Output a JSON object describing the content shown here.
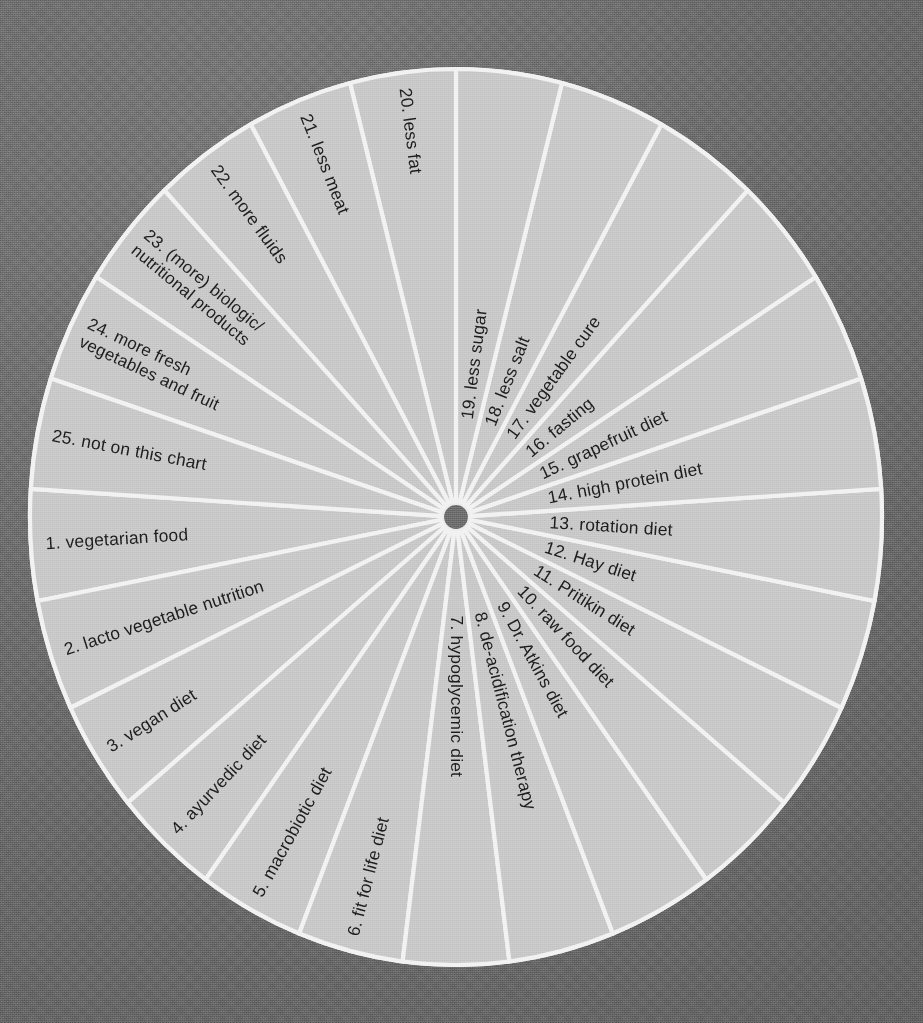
{
  "figure": {
    "type": "radial-wheel-diagram",
    "sector_count": 25,
    "background_color": "#6f6f6f",
    "sector_fill_color": "#c9c9c9",
    "divider_color": "#f2f2f2",
    "label_color": "#1d1d1d",
    "hub_color": "#6f6f6f"
  },
  "chart_data": {
    "type": "pie",
    "xlabel": "",
    "ylabel": "",
    "legend_position": "none",
    "grid": false,
    "note": "25 equal sectors of 14.4 degrees each; a divider line sits exactly at 12 o'clock between sector 19 and sector 20. Sector 1 begins just below the 9 o'clock position and numbering runs counter-clockwise... as drawn, numbers increase clockwise from the lower-left around the bottom and up the right side.",
    "categories": [
      "1. vegetarian food",
      "2. lacto vegetable nutrition",
      "3. vegan diet",
      "4. ayurvedic diet",
      "5. macrobiotic diet",
      "6. fit for life diet",
      "7. hypoglycemic diet",
      "8. de-acidification therapy",
      "9. Dr. Atkins diet",
      "10. raw food diet",
      "11. Pritikin diet",
      "12. Hay diet",
      "13. rotation diet",
      "14. high protein diet",
      "15. grapefruit diet",
      "16. fasting",
      "17. vegetable cure",
      "18. less salt",
      "19. less sugar",
      "20. less fat",
      "21. less meat",
      "22. more fluids",
      "23. (more) biologic/ nutritional products",
      "24. more fresh vegetables and fruit",
      "25. not on this chart"
    ],
    "values": [
      4,
      4,
      4,
      4,
      4,
      4,
      4,
      4,
      4,
      4,
      4,
      4,
      4,
      4,
      4,
      4,
      4,
      4,
      4,
      4,
      4,
      4,
      4,
      4,
      4
    ]
  },
  "sectors": [
    {
      "number": "1.",
      "text": "vegetarian food",
      "lines": [
        "1.  vegetarian food"
      ]
    },
    {
      "number": "2.",
      "text": "lacto vegetable nutrition",
      "lines": [
        "2.  lacto vegetable nutrition"
      ]
    },
    {
      "number": "3.",
      "text": "vegan diet",
      "lines": [
        "3.  vegan diet"
      ]
    },
    {
      "number": "4.",
      "text": "ayurvedic diet",
      "lines": [
        "4.  ayurvedic diet"
      ]
    },
    {
      "number": "5.",
      "text": "macrobiotic diet",
      "lines": [
        "5.  macrobiotic diet"
      ]
    },
    {
      "number": "6.",
      "text": "fit for life diet",
      "lines": [
        "6.  fit for life diet"
      ]
    },
    {
      "number": "7.",
      "text": "hypoglycemic diet",
      "lines": [
        "7.  hypoglycemic diet"
      ]
    },
    {
      "number": "8.",
      "text": "de-acidification therapy",
      "lines": [
        "8.  de-acidification therapy"
      ]
    },
    {
      "number": "9.",
      "text": "Dr. Atkins diet",
      "lines": [
        "9.  Dr. Atkins diet"
      ]
    },
    {
      "number": "10.",
      "text": "raw food diet",
      "lines": [
        "10.  raw food diet"
      ]
    },
    {
      "number": "11.",
      "text": "Pritikin diet",
      "lines": [
        "11.  Pritikin diet"
      ]
    },
    {
      "number": "12.",
      "text": "Hay diet",
      "lines": [
        "12.  Hay diet"
      ]
    },
    {
      "number": "13.",
      "text": "rotation diet",
      "lines": [
        "13.  rotation diet"
      ]
    },
    {
      "number": "14.",
      "text": "high protein diet",
      "lines": [
        "14.  high protein diet"
      ]
    },
    {
      "number": "15.",
      "text": "grapefruit diet",
      "lines": [
        "15.  grapefruit diet"
      ]
    },
    {
      "number": "16.",
      "text": "fasting",
      "lines": [
        "16.  fasting"
      ]
    },
    {
      "number": "17.",
      "text": "vegetable cure",
      "lines": [
        "17.  vegetable cure"
      ]
    },
    {
      "number": "18.",
      "text": "less salt",
      "lines": [
        "18.  less salt"
      ]
    },
    {
      "number": "19.",
      "text": "less sugar",
      "lines": [
        "19.  less sugar"
      ]
    },
    {
      "number": "20.",
      "text": "less fat",
      "lines": [
        "20.  less fat"
      ]
    },
    {
      "number": "21.",
      "text": "less meat",
      "lines": [
        "21.  less meat"
      ]
    },
    {
      "number": "22.",
      "text": "more fluids",
      "lines": [
        "22.  more fluids"
      ]
    },
    {
      "number": "23.",
      "text": "(more) biologic/ nutritional products",
      "lines": [
        "23.  (more) biologic/",
        "nutritional products"
      ]
    },
    {
      "number": "24.",
      "text": "more fresh vegetables and fruit",
      "lines": [
        "24.  more fresh",
        "vegetables and fruit"
      ]
    },
    {
      "number": "25.",
      "text": "not on this chart",
      "lines": [
        "25.  not on this chart"
      ]
    }
  ]
}
